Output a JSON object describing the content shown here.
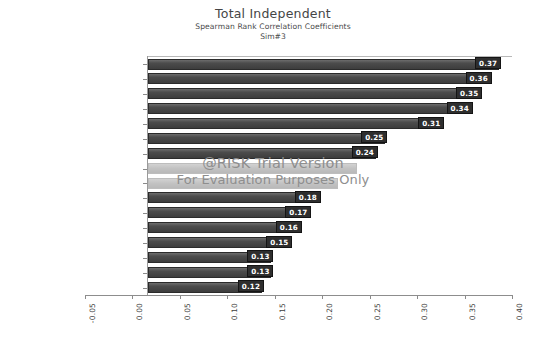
{
  "chart_data": {
    "type": "bar",
    "orientation": "horizontal",
    "title": "Total Independent",
    "subtitle": "Spearman Rank Correlation Coefficients",
    "sim_label": "Sim#3",
    "xlabel": "",
    "ylabel": "",
    "xlim": [
      -0.05,
      0.4
    ],
    "xticks": [
      "-0.05",
      "0.00",
      "0.05",
      "0.10",
      "0.15",
      "0.20",
      "0.25",
      "0.30",
      "0.35",
      "0.40"
    ],
    "xtick_values": [
      -0.05,
      0.0,
      0.05,
      0.1,
      0.15,
      0.2,
      0.25,
      0.3,
      0.35,
      0.4
    ],
    "grid": false,
    "legend": "none",
    "categories": [
      "Interest rate / 2",
      "Interest rate / 3",
      "Interest rate / 1",
      "Interest rate / 6",
      "Interest rate / 4",
      "Interest rate / 5",
      "Interest rate / 8",
      "Interest rate / 9",
      "Interest rate / 7",
      "Interest rate / 11",
      "Interest rate / 13",
      "Interest rate / 10",
      "Interest rate / 12",
      "Interest rate / 15",
      "Interest rate / 14",
      "Interest rate / 16"
    ],
    "values": [
      0.37,
      0.36,
      0.35,
      0.34,
      0.31,
      0.25,
      0.24,
      0.22,
      0.2,
      0.18,
      0.17,
      0.16,
      0.15,
      0.13,
      0.13,
      0.12
    ],
    "value_labels": [
      "0.37",
      "0.36",
      "0.35",
      "0.34",
      "0.31",
      "0.25",
      "0.24",
      "",
      "",
      "0.18",
      "0.17",
      "0.16",
      "0.15",
      "0.13",
      "0.13",
      "0.12"
    ],
    "bar_color": "#3d3d3d",
    "label_bg_color": "#2e2e2e",
    "label_text_color": "#ffffff"
  },
  "watermark": {
    "line1": "@RISK Trial Version",
    "line2": "For Evaluation Purposes Only",
    "color": "#8e8e8e"
  }
}
